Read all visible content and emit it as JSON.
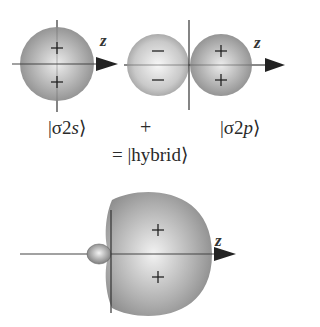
{
  "figure": {
    "axis_label": "z",
    "orbitals": [
      {
        "name": "sigma-2s",
        "ket_prefix": "|σ2",
        "ket_italic": "s",
        "ket_suffix": "⟩",
        "signs": [
          "+",
          "+"
        ]
      },
      {
        "name": "sigma-2p",
        "ket_prefix": "|σ2",
        "ket_italic": "p",
        "ket_suffix": "⟩",
        "signs_left": [
          "−",
          "−"
        ],
        "signs_right": [
          "+",
          "+"
        ]
      },
      {
        "name": "hybrid",
        "ket": "= |hybrid⟩",
        "signs": [
          "+",
          "+"
        ]
      }
    ],
    "operator": "+",
    "colors": {
      "lobe_dark": "#8a8a8a",
      "lobe_light": "#e8e8e8",
      "axis": "#333333"
    }
  }
}
